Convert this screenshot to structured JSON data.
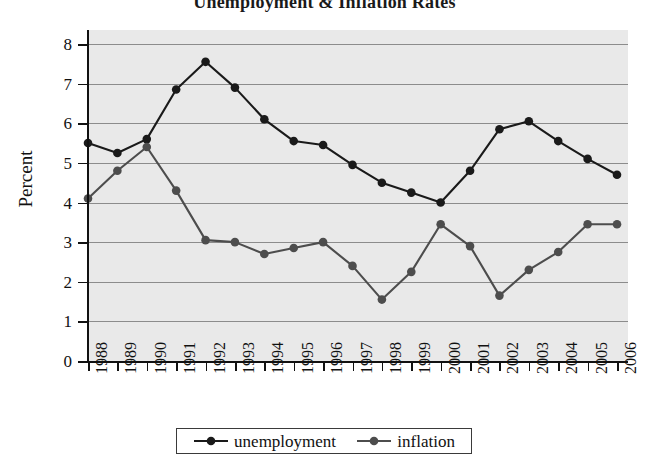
{
  "chart_data": {
    "type": "line",
    "title": "Unemployment & Inflation Rates",
    "xlabel": "",
    "ylabel": "Percent",
    "categories": [
      "1988",
      "1989",
      "1990",
      "1991",
      "1992",
      "1993",
      "1994",
      "1995",
      "1996",
      "1997",
      "1998",
      "1999",
      "2000",
      "2001",
      "2002",
      "2003",
      "2004",
      "2005",
      "2006"
    ],
    "x": [
      1988,
      1989,
      1990,
      1991,
      1992,
      1993,
      1994,
      1995,
      1996,
      1997,
      1998,
      1999,
      2000,
      2001,
      2002,
      2003,
      2004,
      2005,
      2006
    ],
    "series": [
      {
        "name": "unemployment",
        "color": "#1a1a1a",
        "values": [
          5.5,
          5.25,
          5.6,
          6.85,
          7.55,
          6.9,
          6.1,
          5.55,
          5.45,
          4.95,
          4.5,
          4.25,
          4.0,
          4.8,
          5.85,
          6.05,
          5.55,
          5.1,
          4.7
        ]
      },
      {
        "name": "inflation",
        "color": "#4d4d4d",
        "values": [
          4.1,
          4.8,
          5.4,
          4.3,
          3.05,
          3.0,
          2.7,
          2.85,
          3.0,
          2.4,
          1.55,
          2.25,
          3.45,
          2.9,
          1.65,
          2.3,
          2.75,
          3.45,
          3.45
        ]
      }
    ],
    "ylim": [
      0,
      8
    ],
    "yticks": [
      0,
      1,
      2,
      3,
      4,
      5,
      6,
      7,
      8
    ],
    "ytick_labels": [
      "0",
      "1",
      "2",
      "3",
      "4",
      "5",
      "6",
      "7",
      "8"
    ],
    "grid": true,
    "grid_axis": "y",
    "legend_position": "bottom",
    "plot_background": "#e9e9e9",
    "grid_color": "#8c8c8c",
    "figure_background": "#ffffff"
  },
  "legend": {
    "entries": [
      {
        "label": "unemployment"
      },
      {
        "label": "inflation"
      }
    ]
  }
}
